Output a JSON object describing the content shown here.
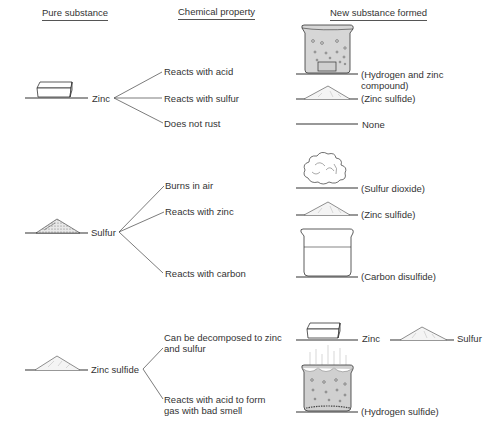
{
  "headers": {
    "pure_substance": "Pure substance",
    "chemical_property": "Chemical property",
    "new_substance": "New substance formed"
  },
  "substances": [
    {
      "name": "Zinc",
      "icon": "zinc-block",
      "properties": [
        {
          "label": "Reacts with acid",
          "product": "(Hydrogen and zinc compound)",
          "product_line1": "(Hydrogen and zinc",
          "product_line2": "compound)",
          "product_icon": "beaker-bubbling-with-zinc"
        },
        {
          "label": "Reacts with sulfur",
          "product": "(Zinc sulfide)",
          "product_icon": "powder-pile"
        },
        {
          "label": "Does not rust",
          "product": "None",
          "product_icon": "none"
        }
      ]
    },
    {
      "name": "Sulfur",
      "icon": "sulfur-pile",
      "properties": [
        {
          "label": "Burns in air",
          "product": "(Sulfur dioxide)",
          "product_icon": "gas-cloud"
        },
        {
          "label": "Reacts with zinc",
          "product": "(Zinc sulfide)",
          "product_icon": "powder-pile"
        },
        {
          "label": "Reacts with carbon",
          "product": "(Carbon disulfide)",
          "product_icon": "beaker-liquid"
        }
      ]
    },
    {
      "name": "Zinc sulfide",
      "icon": "powder-pile",
      "properties": [
        {
          "label": "Can be decomposed to zinc and sulfur",
          "label_line1": "Can be decomposed to zinc",
          "label_line2": "and sulfur",
          "products": [
            {
              "label": "Zinc",
              "icon": "zinc-block"
            },
            {
              "label": "Sulfur",
              "icon": "sulfur-pile"
            }
          ]
        },
        {
          "label": "Reacts with acid to form gas with bad smell",
          "label_line1": "Reacts with acid to form",
          "label_line2": "gas with bad smell",
          "product": "(Hydrogen sulfide)",
          "product_icon": "beaker-bubbling-gas"
        }
      ]
    }
  ]
}
